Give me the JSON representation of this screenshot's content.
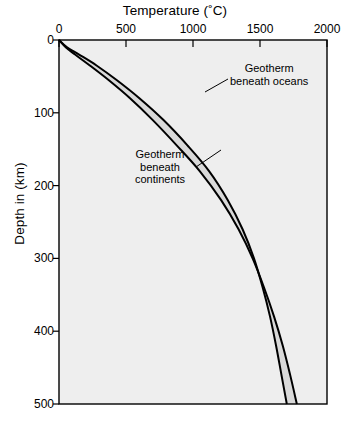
{
  "chart_data": {
    "type": "line",
    "title": "",
    "xlabel": "Temperature (˚C)",
    "ylabel": "Depth in (km)",
    "xlim": [
      0,
      2000
    ],
    "ylim": [
      0,
      500
    ],
    "y_inverted": true,
    "grid": false,
    "legend_position": "inline-annotations",
    "xticks": [
      0,
      500,
      1000,
      1500,
      2000
    ],
    "xtick_labels": [
      "0",
      "500",
      "1000",
      "1500",
      "2000"
    ],
    "yticks": [
      0,
      100,
      200,
      300,
      400,
      500
    ],
    "ytick_labels": [
      "0",
      "100",
      "200",
      "300",
      "400",
      "500"
    ],
    "band_fill_color": "#d9d9d9",
    "plot_background_color": "#eeeeee",
    "line_color": "#000000",
    "series": [
      {
        "name": "Geotherm beneath oceans",
        "note": "upper/left curve - hotter at shallow depth",
        "x": [
          0,
          60,
          150,
          280,
          430,
          600,
          780,
          960,
          1120,
          1260,
          1370,
          1455,
          1520,
          1575,
          1620,
          1660,
          1700
        ],
        "y": [
          0,
          10,
          20,
          35,
          55,
          80,
          110,
          145,
          180,
          220,
          260,
          300,
          340,
          380,
          420,
          460,
          500
        ]
      },
      {
        "name": "Geotherm beneath continents",
        "note": "lower/right curve - cooler at shallow depth",
        "x": [
          0,
          50,
          120,
          230,
          370,
          530,
          700,
          880,
          1050,
          1210,
          1340,
          1445,
          1530,
          1605,
          1670,
          1725,
          1775
        ],
        "y": [
          0,
          10,
          20,
          35,
          55,
          80,
          110,
          145,
          180,
          220,
          260,
          300,
          340,
          380,
          420,
          460,
          500
        ]
      }
    ],
    "annotations": [
      {
        "name": "oceans-annotation",
        "lines": [
          "Geotherm",
          "beneath oceans"
        ],
        "text": "Geotherm beneath oceans"
      },
      {
        "name": "continents-annotation",
        "lines": [
          "Geotherm",
          "beneath",
          "continents"
        ],
        "text": "Geotherm beneath continents"
      }
    ]
  }
}
